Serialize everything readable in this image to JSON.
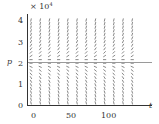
{
  "chart_data": {
    "type": "slope_field",
    "title": "",
    "xlabel": "t",
    "ylabel": "p",
    "y_scale_label": "× 10⁴",
    "xlim": [
      0,
      100
    ],
    "ylim": [
      0,
      4
    ],
    "x_ticks": [
      0,
      50,
      100
    ],
    "y_ticks": [
      0,
      1,
      2,
      3,
      4
    ],
    "x_tick_labels": [
      "0",
      "50",
      "100"
    ],
    "y_tick_labels": [
      "0",
      "1",
      "2",
      "3",
      "4"
    ],
    "equilibrium": {
      "p": 2,
      "label": "equilibrium line"
    },
    "slope_sign_above_equilibrium": "positive",
    "slope_sign_below_equilibrium": "negative",
    "grid": false,
    "legend": null,
    "colors": {
      "axis": "#333333",
      "segments": "#555555",
      "equilibrium_line": "#999999"
    }
  },
  "labels": {
    "scale": "× 10",
    "scale_exp": "4",
    "xlabel": "t",
    "ylabel": "p",
    "xt0": "0",
    "xt50": "50",
    "xt100": "100",
    "yt0": "0",
    "yt1": "1",
    "yt2": "2",
    "yt3": "3",
    "yt4": "4"
  }
}
